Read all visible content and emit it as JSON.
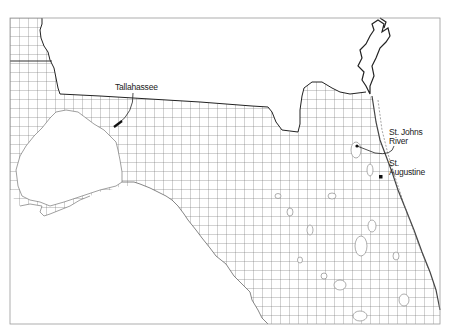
{
  "map": {
    "region": "North Florida",
    "frame": {
      "x": 10,
      "y": 18,
      "width": 430,
      "height": 306,
      "stroke": "#999999"
    },
    "grid": {
      "cell_size": 9,
      "stroke": "#555555",
      "origin_x": 10,
      "origin_y": 18
    },
    "colors": {
      "background": "#ffffff",
      "land": "#ffffff",
      "water": "#ffffff",
      "boundary": "#222222",
      "coast": "#666666",
      "grid": "#555555"
    },
    "labels": {
      "tallahassee": "Tallahassee",
      "st_johns_line1": "St. Johns",
      "st_johns_line2": "River",
      "st_augustine_line1": "St.",
      "st_augustine_line2": "Augustine"
    },
    "markers": [
      {
        "name": "Tallahassee",
        "x": 117,
        "y": 125
      },
      {
        "name": "St. Johns River",
        "x": 357,
        "y": 146
      },
      {
        "name": "St. Augustine",
        "x": 381,
        "y": 177
      }
    ]
  }
}
